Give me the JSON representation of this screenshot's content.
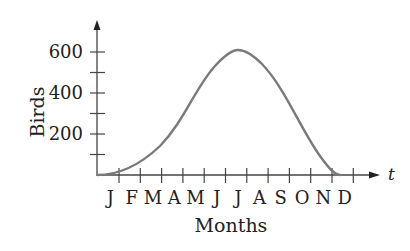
{
  "chart_data": {
    "type": "line",
    "title": "",
    "xlabel": "Months",
    "ylabel": "Birds",
    "x_axis_var": "t",
    "categories": [
      "J",
      "F",
      "M",
      "A",
      "M",
      "J",
      "J",
      "A",
      "S",
      "O",
      "N",
      "D"
    ],
    "y_ticks": [
      200,
      400,
      600
    ],
    "y_minor_ticks": [
      100,
      300,
      500
    ],
    "ylim": [
      0,
      700
    ],
    "grid": false,
    "legend": null,
    "series": [
      {
        "name": "Birds",
        "x": [
          0,
          1,
          2,
          3,
          4,
          5,
          5.5,
          6,
          7,
          8,
          9,
          10,
          11
        ],
        "values": [
          0,
          20,
          80,
          200,
          340,
          480,
          560,
          600,
          560,
          420,
          230,
          60,
          0
        ]
      }
    ],
    "peak": {
      "x": 6.5,
      "y": 610
    },
    "colors": {
      "curve": "#7a7a7a",
      "axis": "#444444",
      "text": "#222222"
    }
  }
}
